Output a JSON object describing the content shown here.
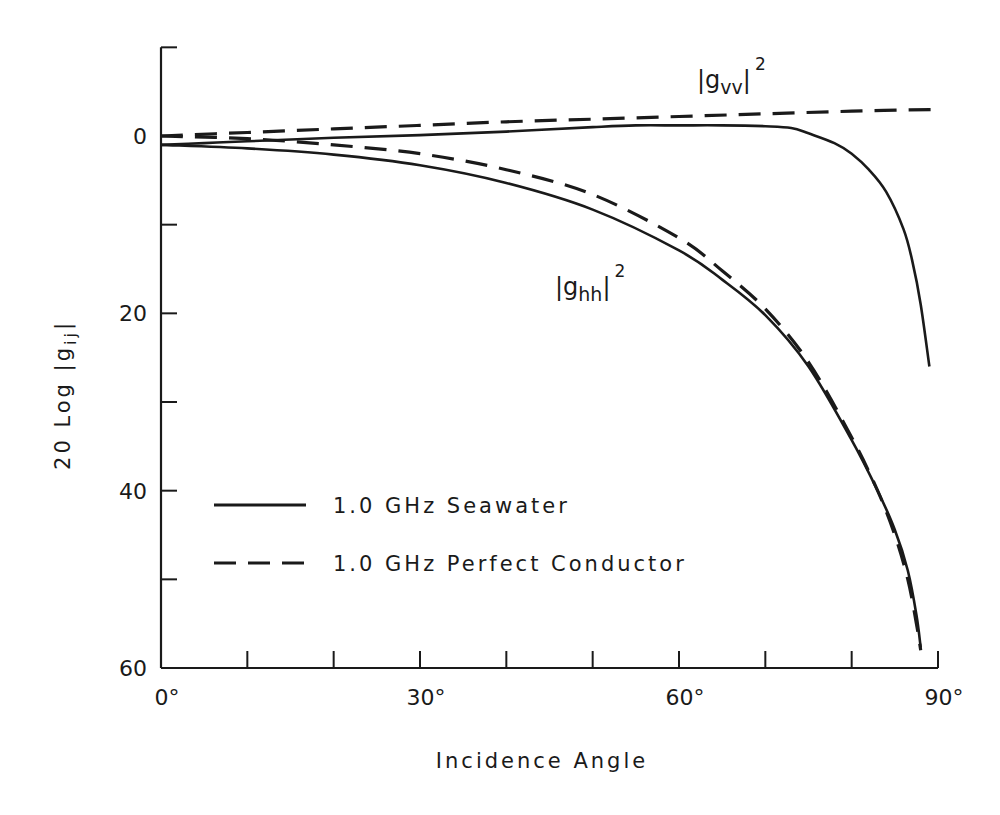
{
  "chart_data": {
    "type": "line",
    "title": "",
    "xlabel": "Incidence Angle",
    "ylabel": "20 Log |g ij|",
    "xlim": [
      0,
      90
    ],
    "ylim": [
      60,
      -10
    ],
    "y_inverted": true,
    "grid": false,
    "x_ticks": [
      0,
      10,
      20,
      30,
      40,
      50,
      60,
      70,
      80,
      90
    ],
    "x_tick_labels": [
      {
        "value": 0,
        "label": "0°"
      },
      {
        "value": 30,
        "label": "30°"
      },
      {
        "value": 60,
        "label": "60°"
      },
      {
        "value": 90,
        "label": "90°"
      }
    ],
    "y_ticks": [
      -10,
      0,
      10,
      20,
      30,
      40,
      50,
      60
    ],
    "y_tick_labels": [
      {
        "value": 0,
        "label": "0"
      },
      {
        "value": 20,
        "label": "20"
      },
      {
        "value": 40,
        "label": "40"
      },
      {
        "value": 60,
        "label": "60"
      }
    ],
    "legend": {
      "position": "lower-left-inside",
      "entries": [
        {
          "label": "1.0 GHz  Seawater",
          "style": "solid"
        },
        {
          "label": "1.0 GHz  Perfect  Conductor",
          "style": "dashed"
        }
      ]
    },
    "annotations": [
      {
        "id": "vv",
        "base": "|g",
        "sub": "vv",
        "close": "|",
        "sup": "2",
        "text": "|g_vv|^2"
      },
      {
        "id": "hh",
        "base": "|g",
        "sub": "hh",
        "close": "|",
        "sup": "2",
        "text": "|g_hh|^2"
      }
    ],
    "series": [
      {
        "name": "|g_vv|^2 1.0 GHz Seawater",
        "style": "solid",
        "x": [
          0,
          5,
          10,
          20,
          30,
          40,
          50,
          55,
          60,
          65,
          70,
          73,
          75,
          78,
          80,
          82,
          84,
          86,
          87,
          88,
          89
        ],
        "values": [
          1.0,
          0.8,
          0.6,
          0.2,
          -0.1,
          -0.5,
          -1.0,
          -1.2,
          -1.2,
          -1.2,
          -1.1,
          -0.9,
          -0.3,
          0.8,
          2.0,
          3.8,
          6.3,
          10.5,
          14.0,
          19.0,
          26.0
        ]
      },
      {
        "name": "|g_vv|^2 1.0 GHz Perfect Conductor",
        "style": "dashed",
        "x": [
          0,
          10,
          20,
          30,
          40,
          50,
          60,
          70,
          80,
          90
        ],
        "values": [
          0.0,
          -0.4,
          -0.8,
          -1.2,
          -1.6,
          -1.9,
          -2.2,
          -2.5,
          -2.8,
          -3.0
        ]
      },
      {
        "name": "|g_hh|^2 1.0 GHz Seawater",
        "style": "solid",
        "x": [
          0,
          10,
          20,
          30,
          40,
          50,
          60,
          65,
          70,
          75,
          80,
          83,
          85,
          86.5,
          87.5,
          88
        ],
        "values": [
          1.0,
          1.4,
          2.1,
          3.3,
          5.3,
          8.3,
          12.9,
          16.2,
          20.2,
          26.0,
          34.3,
          40.0,
          44.4,
          49.0,
          54.0,
          57.7
        ]
      },
      {
        "name": "|g_hh|^2 1.0 GHz Perfect Conductor",
        "style": "dashed",
        "x": [
          0,
          10,
          20,
          30,
          40,
          50,
          60,
          65,
          70,
          75,
          80,
          83,
          85,
          86.5,
          87.5,
          88
        ],
        "values": [
          0.0,
          0.3,
          1.0,
          2.0,
          3.8,
          6.6,
          11.5,
          15.2,
          19.5,
          25.5,
          34.0,
          40.0,
          45.0,
          50.0,
          55.0,
          58.0
        ]
      }
    ]
  }
}
